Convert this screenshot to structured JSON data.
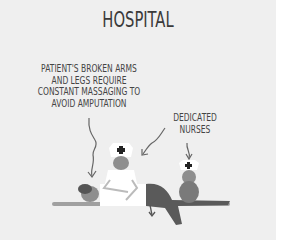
{
  "title": "HOSPITAL",
  "captions": {
    "patient": "PATIENT'S BROKEN ARMS\nAND LEGS REQUIRE\nCONSTANT MASSAGING TO\nAVOID AMPUTATION",
    "nurses": "DEDICATED\nNURSES"
  },
  "colors": {
    "background": "#efefef",
    "text": "#3a3a3a",
    "nurse_uniform": "#ffffff",
    "patient_clothes": "#5a5a5a",
    "skin_gray": "#8a8a8a",
    "bed": "#9a9a9a"
  }
}
